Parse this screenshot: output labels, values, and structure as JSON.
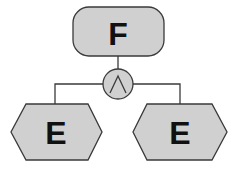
{
  "diagram": {
    "type": "fault-tree",
    "colors": {
      "fill": "#d0d0d0",
      "stroke": "#3a3a3a",
      "text": "#111111",
      "background": "#ffffff"
    },
    "top_event": {
      "label": "F",
      "shape": "rounded-rectangle"
    },
    "gate": {
      "type": "AND",
      "symbol": "∧",
      "shape": "circle"
    },
    "children": [
      {
        "label": "E",
        "shape": "hexagon"
      },
      {
        "label": "E",
        "shape": "hexagon"
      }
    ]
  }
}
